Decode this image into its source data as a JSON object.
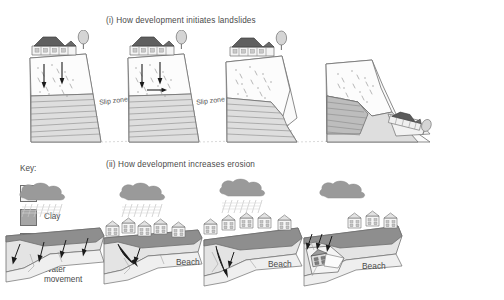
{
  "figure": {
    "background": "#ffffff",
    "sections": [
      {
        "id": "i",
        "title": "(i) How development initiates landslides"
      },
      {
        "id": "ii",
        "title": "(ii) How development increases erosion"
      }
    ]
  },
  "key": {
    "heading": "Key:",
    "items": [
      {
        "swatch": "soil-swatch",
        "label": "Soil",
        "color": "#f2f2f2"
      },
      {
        "swatch": "clay-swatch",
        "label": "Clay",
        "color": "#a6a6a6"
      },
      {
        "swatch": "loose-swatch",
        "label": "Loosely consolidated material",
        "color": "#fbfbfb"
      },
      {
        "swatch": "water-arrow-icon",
        "label": "Water movement",
        "color": "#1a1a1a"
      }
    ],
    "loose_line1": "Loosely",
    "loose_line2": "consolidated",
    "loose_line3": "material",
    "water_line1": "Water",
    "water_line2": "movement"
  },
  "landslide_row": {
    "panels": [
      {
        "stage": 1,
        "slip_zone_label": "Slip zone",
        "has_houses": true,
        "has_tree": true,
        "arrows": 2,
        "collapsed": false
      },
      {
        "stage": 2,
        "slip_zone_label": "Slip zone",
        "has_houses": true,
        "has_tree": true,
        "arrows": 3,
        "collapsed": false
      },
      {
        "stage": 3,
        "slip_zone_label": "",
        "has_houses": true,
        "has_tree": true,
        "arrows": 0,
        "collapsed": false
      },
      {
        "stage": 4,
        "slip_zone_label": "",
        "has_houses": true,
        "has_tree": true,
        "arrows": 0,
        "collapsed": true
      }
    ]
  },
  "erosion_row": {
    "panels": [
      {
        "stage": 1,
        "beach_label": "Beach",
        "houses": 0,
        "has_cloud": true,
        "has_rain": true,
        "arrows": 4,
        "collapsed": false
      },
      {
        "stage": 2,
        "beach_label": "Beach",
        "houses": 5,
        "has_cloud": true,
        "has_rain": true,
        "arrows": 2,
        "collapsed": false
      },
      {
        "stage": 3,
        "beach_label": "Beach",
        "houses": 5,
        "has_cloud": true,
        "has_rain": true,
        "arrows": 2,
        "collapsed": false
      },
      {
        "stage": 4,
        "beach_label": "",
        "houses": 3,
        "has_cloud": true,
        "has_rain": false,
        "arrows": 3,
        "collapsed": true
      }
    ]
  },
  "palette": {
    "clay": "#a6a6a6",
    "clay_dark": "#8e8e8e",
    "soil": "#f2f2f2",
    "loose": "#fbfbfb",
    "cliff": "#dcdcdc",
    "cloud": "#9a9a9a",
    "roof": "#5a5a5a",
    "outline": "#6f6f6f",
    "text": "#4a4a4a"
  }
}
